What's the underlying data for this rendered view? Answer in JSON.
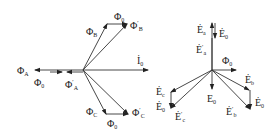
{
  "left_diagram": {
    "labels": {
      "phi_A": {
        "base": "Φ",
        "sub": "A",
        "prime": ""
      },
      "phi_0_left": {
        "base": "Φ",
        "sub": "0",
        "prime": ""
      },
      "phi_A_prime": {
        "base": "Φ",
        "sub": "A",
        "prime": "′"
      },
      "phi_B": {
        "base": "Φ",
        "sub": "B",
        "prime": ""
      },
      "phi_0_top": {
        "base": "Φ",
        "sub": "0",
        "prime": ""
      },
      "phi_B_prime": {
        "base": "Φ",
        "sub": "B",
        "prime": "′"
      },
      "I_0": {
        "base": "İ",
        "sub": "0",
        "prime": ""
      },
      "phi_C": {
        "base": "Φ",
        "sub": "C",
        "prime": ""
      },
      "phi_0_bottom": {
        "base": "Φ",
        "sub": "0",
        "prime": ""
      },
      "phi_C_prime": {
        "base": "Φ",
        "sub": "C",
        "prime": "′"
      }
    }
  },
  "right_diagram": {
    "labels": {
      "E_a": {
        "base": "Ė",
        "sub": "a",
        "prime": ""
      },
      "E_0_top": {
        "base": "Ė",
        "sub": "0",
        "prime": ""
      },
      "E_a_prime": {
        "base": "Ė",
        "sub": "a",
        "prime": "′"
      },
      "phi_0": {
        "base": "Φ",
        "sub": "0",
        "prime": ""
      },
      "E_c": {
        "base": "Ė",
        "sub": "c",
        "prime": ""
      },
      "E_0_left": {
        "base": "Ė",
        "sub": "0",
        "prime": ""
      },
      "E_c_prime": {
        "base": "Ė",
        "sub": "c",
        "prime": "′"
      },
      "E_0_center": {
        "base": "E",
        "sub": "0",
        "prime": ""
      },
      "E_b": {
        "base": "Ė",
        "sub": "b",
        "prime": ""
      },
      "E_0_right": {
        "base": "Ė",
        "sub": "0",
        "prime": ""
      },
      "E_b_prime": {
        "base": "Ė",
        "sub": "b",
        "prime": "′"
      }
    }
  }
}
